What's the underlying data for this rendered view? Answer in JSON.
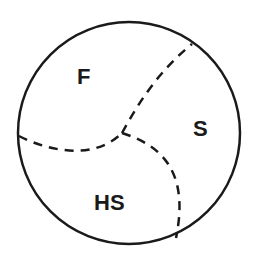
{
  "diagram": {
    "type": "circle-partition",
    "regions": [
      {
        "label": "F"
      },
      {
        "label": "S"
      },
      {
        "label": "HS"
      }
    ],
    "colors": {
      "stroke": "#1a1a1a",
      "background": "#ffffff"
    }
  }
}
